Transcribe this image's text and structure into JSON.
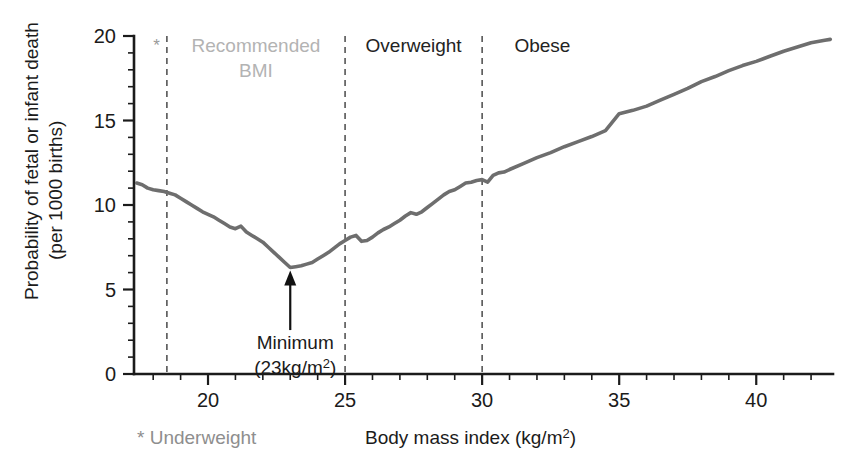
{
  "chart_data": {
    "type": "line",
    "title": "",
    "xlabel": "Body mass index (kg/m2)",
    "xlabel_main": "Body mass index (kg/m",
    "xlabel_sup": "2",
    "xlabel_tail": ")",
    "ylabel_line1": "Probability of fetal or infant death",
    "ylabel_line2": "(per 1000 births)",
    "xlim": [
      17.3,
      42.8
    ],
    "ylim": [
      0,
      20
    ],
    "xticks": [
      20,
      25,
      30,
      35,
      40
    ],
    "xtick_labels": [
      "20",
      "25",
      "30",
      "35",
      "40"
    ],
    "xtick_minor_step": 1,
    "yticks": [
      0,
      5,
      10,
      15,
      20
    ],
    "ytick_labels": [
      "0",
      "5",
      "10",
      "15",
      "20"
    ],
    "ytick_minor_step": 1,
    "grid": false,
    "legend": "none",
    "series_color": "#6e6e6e",
    "x": [
      17.4,
      17.6,
      17.8,
      18.0,
      18.2,
      18.4,
      18.6,
      18.8,
      19.0,
      19.2,
      19.4,
      19.6,
      19.8,
      20.0,
      20.2,
      20.4,
      20.6,
      20.8,
      21.0,
      21.2,
      21.4,
      21.6,
      21.8,
      22.0,
      22.2,
      22.4,
      22.6,
      22.8,
      23.0,
      23.2,
      23.4,
      23.6,
      23.8,
      24.0,
      24.2,
      24.4,
      24.6,
      24.8,
      25.0,
      25.2,
      25.4,
      25.6,
      25.8,
      26.0,
      26.2,
      26.4,
      26.6,
      26.8,
      27.0,
      27.2,
      27.4,
      27.6,
      27.8,
      28.0,
      28.2,
      28.4,
      28.6,
      28.8,
      29.0,
      29.2,
      29.4,
      29.6,
      29.8,
      30.0,
      30.2,
      30.4,
      30.6,
      30.8,
      31.0,
      31.5,
      32.0,
      32.5,
      33.0,
      33.5,
      34.0,
      34.5,
      35.0,
      35.5,
      36.0,
      36.5,
      37.0,
      37.5,
      38.0,
      38.5,
      39.0,
      39.5,
      40.0,
      40.5,
      41.0,
      41.5,
      42.0,
      42.5,
      42.7
    ],
    "y": [
      11.3,
      11.2,
      11.0,
      10.9,
      10.85,
      10.8,
      10.7,
      10.6,
      10.4,
      10.2,
      10.0,
      9.8,
      9.6,
      9.45,
      9.3,
      9.1,
      8.9,
      8.7,
      8.6,
      8.75,
      8.4,
      8.2,
      8.0,
      7.8,
      7.5,
      7.2,
      6.9,
      6.6,
      6.3,
      6.35,
      6.4,
      6.5,
      6.6,
      6.8,
      7.0,
      7.2,
      7.45,
      7.7,
      7.9,
      8.1,
      8.2,
      7.85,
      7.9,
      8.1,
      8.35,
      8.55,
      8.7,
      8.9,
      9.1,
      9.35,
      9.55,
      9.45,
      9.6,
      9.85,
      10.1,
      10.35,
      10.6,
      10.8,
      10.9,
      11.1,
      11.3,
      11.35,
      11.45,
      11.5,
      11.35,
      11.75,
      11.9,
      11.95,
      12.1,
      12.45,
      12.8,
      13.1,
      13.45,
      13.75,
      14.05,
      14.4,
      15.4,
      15.6,
      15.85,
      16.2,
      16.55,
      16.9,
      17.3,
      17.6,
      17.95,
      18.25,
      18.5,
      18.8,
      19.1,
      19.35,
      19.6,
      19.75,
      19.8
    ],
    "dividers": [
      {
        "x": 18.5,
        "label": "",
        "label_color": ""
      },
      {
        "x": 25.0,
        "label": "",
        "label_color": ""
      },
      {
        "x": 30.0,
        "label": "",
        "label_color": ""
      }
    ],
    "band_labels": [
      {
        "text_line1": "Recommended",
        "text_line2": "BMI",
        "x_center": 21.75,
        "color": "#b3b3b3",
        "style": "light"
      },
      {
        "text_line1": "Overweight",
        "text_line2": "",
        "x_center": 27.5,
        "color": "#232323",
        "style": "dark"
      },
      {
        "text_line1": "Obese",
        "text_line2": "",
        "x_center": 32.2,
        "color": "#232323",
        "style": "dark"
      }
    ],
    "annotations": [
      {
        "name": "minimum-annotation",
        "text_line1": "Minimum",
        "text_line2_pre": "(23",
        "text_line2_unit": "kg/m",
        "text_line2_sup": "2",
        "text_line2_post": ")",
        "point_x": 23.0,
        "point_y": 6.3,
        "arrow_from_y": 2.6
      }
    ],
    "star_marker": "*",
    "footnote": "* Underweight",
    "footnote_color": "#8e8e8e"
  }
}
